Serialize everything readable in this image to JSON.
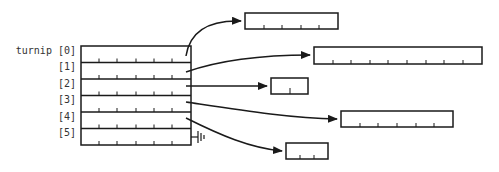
{
  "diagram": {
    "variable_name": "turnip",
    "row_labels": [
      "turnip [0]",
      "[1]",
      "[2]",
      "[3]",
      "[4]",
      "[5]"
    ],
    "rows": [
      {
        "index": 0,
        "target_cells": 5,
        "null": false
      },
      {
        "index": 1,
        "target_cells": 9,
        "null": false
      },
      {
        "index": 2,
        "target_cells": 2,
        "null": false
      },
      {
        "index": 3,
        "target_cells": 6,
        "null": false
      },
      {
        "index": 4,
        "target_cells": 3,
        "null": false
      },
      {
        "index": 5,
        "target_cells": 0,
        "null": true
      }
    ],
    "main_array_cells_per_row": 6,
    "colors": {
      "stroke": "#1a1a1a",
      "background": "#ffffff"
    }
  }
}
